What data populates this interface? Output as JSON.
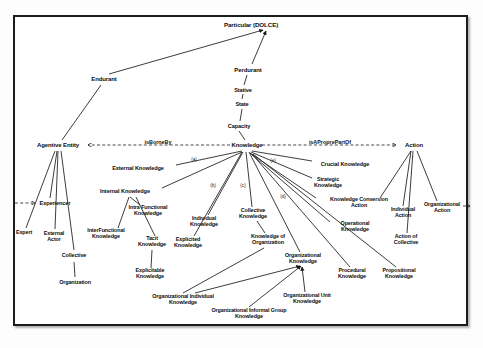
{
  "diagram": {
    "frame_color": "#1c1c1c",
    "line_color": "#1a1a1a",
    "text_color": "#0d0d0d",
    "background": "#ffffff"
  },
  "nodes": [
    {
      "id": "particular",
      "label": "Particular (DOLCE)",
      "x": 251,
      "y": 25,
      "size": "sz-root"
    },
    {
      "id": "endurant",
      "label": "Endurant",
      "x": 104,
      "y": 79,
      "size": "sz-main"
    },
    {
      "id": "perdurant",
      "label": "Perdurant",
      "x": 248,
      "y": 70,
      "size": "sz-main"
    },
    {
      "id": "stative",
      "label": "Stative",
      "x": 243,
      "y": 90,
      "size": "sz-mid"
    },
    {
      "id": "state",
      "label": "State",
      "x": 242,
      "y": 104,
      "size": "sz-mid"
    },
    {
      "id": "capacity",
      "label": "Capacity",
      "x": 239,
      "y": 126,
      "size": "sz-mid"
    },
    {
      "id": "agentive-entity",
      "label": "Agentive Entity",
      "x": 58,
      "y": 145,
      "size": "sz-main"
    },
    {
      "id": "knowledge",
      "label": "Knowledge",
      "x": 247,
      "y": 145,
      "size": "sz-main"
    },
    {
      "id": "action",
      "label": "Action",
      "x": 414,
      "y": 145,
      "size": "sz-main"
    },
    {
      "id": "external-knowledge",
      "label": "External Knowledge",
      "x": 138,
      "y": 168,
      "size": "sz-mid"
    },
    {
      "id": "internal-knowledge",
      "label": "Internal Knowledge",
      "x": 125,
      "y": 191,
      "size": "sz-mid"
    },
    {
      "id": "experiencer",
      "label": "Experiencer",
      "x": 55,
      "y": 203,
      "size": "sz-mid"
    },
    {
      "id": "expert",
      "label": "Expert",
      "x": 24,
      "y": 233,
      "size": "sz-leaf"
    },
    {
      "id": "external-actor",
      "label": "External\nActor",
      "x": 54,
      "y": 237,
      "size": "sz-leaf"
    },
    {
      "id": "collective",
      "label": "Collective",
      "x": 74,
      "y": 256,
      "size": "sz-leaf"
    },
    {
      "id": "organization",
      "label": "Organization",
      "x": 75,
      "y": 283,
      "size": "sz-leaf"
    },
    {
      "id": "inter-functional-knowledge",
      "label": "InterFunctional\nKnowledge",
      "x": 106,
      "y": 234,
      "size": "sz-leaf"
    },
    {
      "id": "intra-functional-knowledge",
      "label": "Intra Functional\nKnowledge",
      "x": 148,
      "y": 211,
      "size": "sz-leaf"
    },
    {
      "id": "tacit-knowledge",
      "label": "Tacit\nKnowledge",
      "x": 152,
      "y": 242,
      "size": "sz-leaf"
    },
    {
      "id": "explicited-knowledge",
      "label": "Explicited\nKnowledge",
      "x": 188,
      "y": 243,
      "size": "sz-leaf"
    },
    {
      "id": "explicitable-knowledge",
      "label": "Explicitable\nKnowledge",
      "x": 150,
      "y": 274,
      "size": "sz-leaf"
    },
    {
      "id": "individual-knowledge",
      "label": "Individual\nKnowledge",
      "x": 204,
      "y": 222,
      "size": "sz-leaf"
    },
    {
      "id": "collective-knowledge",
      "label": "Collective\nKnowledge",
      "x": 253,
      "y": 214,
      "size": "sz-leaf"
    },
    {
      "id": "knowledge-of-organization",
      "label": "Knowledge of\nOrganization",
      "x": 268,
      "y": 240,
      "size": "sz-leaf"
    },
    {
      "id": "organizational-knowledge",
      "label": "Organizational\nKnowledge",
      "x": 303,
      "y": 259,
      "size": "sz-leaf"
    },
    {
      "id": "organizational-individual-knowledge",
      "label": "Organizational Individual\nKnowledge",
      "x": 183,
      "y": 300,
      "size": "sz-leaf"
    },
    {
      "id": "organizational-informal-group-knowledge",
      "label": "Organizational Informal Group\nKnowledge",
      "x": 249,
      "y": 314,
      "size": "sz-leaf"
    },
    {
      "id": "organizational-unit-knowledge",
      "label": "Organizational Unit\nKnowledge",
      "x": 307,
      "y": 299,
      "size": "sz-leaf"
    },
    {
      "id": "crucial-knowledge",
      "label": "Crucial Knowledge",
      "x": 345,
      "y": 164,
      "size": "sz-mid"
    },
    {
      "id": "strategic-knowledge",
      "label": "Strategic\nKnowledge",
      "x": 328,
      "y": 183,
      "size": "sz-leaf"
    },
    {
      "id": "knowledge-conversion-action",
      "label": "Knowledge Conversion\nAction",
      "x": 359,
      "y": 203,
      "size": "sz-leaf"
    },
    {
      "id": "operational-knowledge",
      "label": "Operational\nKnowledge",
      "x": 355,
      "y": 227,
      "size": "sz-leaf"
    },
    {
      "id": "procedural-knowledge",
      "label": "Procedural\nKnowledge",
      "x": 352,
      "y": 274,
      "size": "sz-leaf"
    },
    {
      "id": "propositional-knowledge",
      "label": "Propositional\nKnowledge",
      "x": 399,
      "y": 274,
      "size": "sz-leaf"
    },
    {
      "id": "individual-action",
      "label": "Individual\nAction",
      "x": 403,
      "y": 213,
      "size": "sz-leaf"
    },
    {
      "id": "action-of-collective",
      "label": "Action of\nCollective",
      "x": 406,
      "y": 240,
      "size": "sz-leaf"
    },
    {
      "id": "organizational-action",
      "label": "Organizational\nAction",
      "x": 442,
      "y": 208,
      "size": "sz-leaf"
    }
  ],
  "relations": [
    {
      "id": "is-borne-by",
      "label": "isBorneBy",
      "x": 158,
      "y": 142
    },
    {
      "id": "is-a-propre-part-of",
      "label": "isAProprePartOf",
      "x": 330,
      "y": 142
    }
  ],
  "markers": [
    {
      "id": "marker-a",
      "label": "(a)",
      "x": 194,
      "y": 159
    },
    {
      "id": "marker-b",
      "label": "(b)",
      "x": 213,
      "y": 185
    },
    {
      "id": "marker-c",
      "label": "(c)",
      "x": 243,
      "y": 185
    },
    {
      "id": "marker-d",
      "label": "(d)",
      "x": 283,
      "y": 196
    },
    {
      "id": "marker-e",
      "label": "(e)",
      "x": 273,
      "y": 160
    }
  ],
  "edges": [
    {
      "from": "endurant",
      "to": "particular",
      "x1": 109,
      "y1": 74,
      "x2": 263,
      "y2": 30,
      "arrow": true
    },
    {
      "from": "perdurant",
      "to": "particular",
      "x1": 252,
      "y1": 64,
      "x2": 266,
      "y2": 31,
      "arrow": true
    },
    {
      "from": "stative",
      "to": "perdurant",
      "x1": 244,
      "y1": 85,
      "x2": 247,
      "y2": 75,
      "arrow": false
    },
    {
      "from": "state",
      "to": "stative",
      "x1": 242,
      "y1": 99,
      "x2": 243,
      "y2": 94,
      "arrow": false
    },
    {
      "from": "capacity",
      "to": "state",
      "x1": 240,
      "y1": 121,
      "x2": 242,
      "y2": 109,
      "arrow": false
    },
    {
      "from": "knowledge",
      "to": "capacity",
      "x1": 245,
      "y1": 140,
      "x2": 239,
      "y2": 131,
      "arrow": false
    },
    {
      "from": "agentive-entity",
      "to": "endurant",
      "x1": 62,
      "y1": 140,
      "x2": 101,
      "y2": 85,
      "arrow": false
    },
    {
      "from": "experiencer",
      "to": "agentive-entity",
      "x1": 50,
      "y1": 198,
      "x2": 57,
      "y2": 151,
      "arrow": false
    },
    {
      "from": "expert",
      "to": "agentive-entity",
      "x1": 26,
      "y1": 228,
      "x2": 55,
      "y2": 151,
      "arrow": false
    },
    {
      "from": "external-actor",
      "to": "agentive-entity",
      "x1": 55,
      "y1": 229,
      "x2": 58,
      "y2": 151,
      "arrow": false
    },
    {
      "from": "collective",
      "to": "agentive-entity",
      "x1": 74,
      "y1": 250,
      "x2": 61,
      "y2": 151,
      "arrow": false
    },
    {
      "from": "organization",
      "to": "collective",
      "x1": 75,
      "y1": 277,
      "x2": 74,
      "y2": 262,
      "arrow": false
    },
    {
      "from": "external-knowledge",
      "to": "knowledge",
      "x1": 176,
      "y1": 165,
      "x2": 242,
      "y2": 151,
      "arrow": false
    },
    {
      "from": "internal-knowledge",
      "to": "knowledge",
      "x1": 162,
      "y1": 188,
      "x2": 242,
      "y2": 152,
      "arrow": false
    },
    {
      "from": "intra-functional-knowledge",
      "to": "internal-knowledge",
      "x1": 140,
      "y1": 205,
      "x2": 130,
      "y2": 197,
      "arrow": false
    },
    {
      "from": "inter-functional-knowledge",
      "to": "internal-knowledge",
      "x1": 118,
      "y1": 228,
      "x2": 129,
      "y2": 197,
      "arrow": false
    },
    {
      "from": "tacit-knowledge",
      "to": "internal-knowledge",
      "x1": 155,
      "y1": 236,
      "x2": 136,
      "y2": 197,
      "arrow": false
    },
    {
      "from": "explicitable-knowledge",
      "to": "tacit-knowledge",
      "x1": 151,
      "y1": 268,
      "x2": 152,
      "y2": 250,
      "arrow": false
    },
    {
      "from": "explicited-knowledge",
      "to": "knowledge",
      "x1": 194,
      "y1": 236,
      "x2": 242,
      "y2": 152,
      "arrow": false
    },
    {
      "from": "individual-knowledge",
      "to": "knowledge",
      "x1": 208,
      "y1": 215,
      "x2": 243,
      "y2": 152,
      "arrow": false
    },
    {
      "from": "collective-knowledge",
      "to": "knowledge",
      "x1": 252,
      "y1": 207,
      "x2": 246,
      "y2": 152,
      "arrow": false
    },
    {
      "from": "knowledge-of-organization",
      "to": "collective-knowledge",
      "x1": 265,
      "y1": 233,
      "x2": 257,
      "y2": 221,
      "arrow": false
    },
    {
      "from": "organizational-knowledge",
      "to": "knowledge",
      "x1": 300,
      "y1": 252,
      "x2": 249,
      "y2": 152,
      "arrow": false
    },
    {
      "from": "organizational-individual-knowledge",
      "to": "organizational-knowledge",
      "x1": 195,
      "y1": 293,
      "x2": 300,
      "y2": 266,
      "arrow": true
    },
    {
      "from": "organizational-informal-group-knowledge",
      "to": "organizational-knowledge",
      "x1": 249,
      "y1": 307,
      "x2": 301,
      "y2": 266,
      "arrow": true
    },
    {
      "from": "organizational-unit-knowledge",
      "to": "organizational-knowledge",
      "x1": 305,
      "y1": 292,
      "x2": 302,
      "y2": 267,
      "arrow": true
    },
    {
      "from": "organizational-individual-knowledge",
      "to": "knowledge-of-organization",
      "x1": 183,
      "y1": 293,
      "x2": 264,
      "y2": 248,
      "arrow": false
    },
    {
      "from": "crucial-knowledge",
      "to": "knowledge",
      "x1": 312,
      "y1": 161,
      "x2": 252,
      "y2": 151,
      "arrow": false
    },
    {
      "from": "strategic-knowledge",
      "to": "knowledge",
      "x1": 312,
      "y1": 178,
      "x2": 251,
      "y2": 152,
      "arrow": false
    },
    {
      "from": "knowledge-conversion-action",
      "to": "knowledge",
      "x1": 316,
      "y1": 198,
      "x2": 250,
      "y2": 153,
      "arrow": false
    },
    {
      "from": "operational-knowledge",
      "to": "knowledge",
      "x1": 330,
      "y1": 222,
      "x2": 250,
      "y2": 153,
      "arrow": false
    },
    {
      "from": "procedural-knowledge",
      "to": "knowledge",
      "x1": 350,
      "y1": 267,
      "x2": 252,
      "y2": 154,
      "arrow": false
    },
    {
      "from": "propositional-knowledge",
      "to": "knowledge",
      "x1": 396,
      "y1": 267,
      "x2": 253,
      "y2": 154,
      "arrow": false
    },
    {
      "from": "knowledge-conversion-action",
      "to": "action",
      "x1": 380,
      "y1": 198,
      "x2": 411,
      "y2": 151,
      "arrow": false
    },
    {
      "from": "individual-action",
      "to": "action",
      "x1": 403,
      "y1": 206,
      "x2": 411,
      "y2": 151,
      "arrow": false
    },
    {
      "from": "action-of-collective",
      "to": "action",
      "x1": 407,
      "y1": 233,
      "x2": 413,
      "y2": 151,
      "arrow": false
    },
    {
      "from": "organizational-action",
      "to": "action",
      "x1": 437,
      "y1": 201,
      "x2": 417,
      "y2": 151,
      "arrow": false
    }
  ],
  "dashed_edges": [
    {
      "id": "dashed-is-borne-by",
      "x1": 230,
      "y1": 145,
      "x2": 88,
      "y2": 145
    },
    {
      "id": "dashed-is-a-propre-part-of",
      "x1": 262,
      "y1": 145,
      "x2": 396,
      "y2": 145
    },
    {
      "id": "dashed-experiencer-left",
      "x1": 15,
      "y1": 203,
      "x2": 35,
      "y2": 203
    },
    {
      "id": "dashed-organizational-action-right",
      "x1": 463,
      "y1": 206,
      "x2": 470,
      "y2": 206
    }
  ]
}
